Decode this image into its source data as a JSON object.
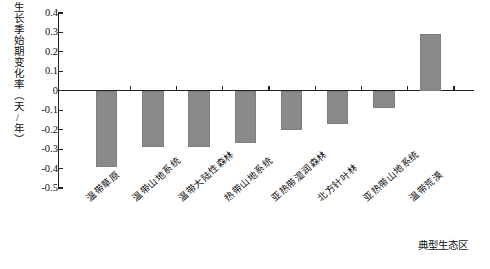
{
  "chart_data": {
    "type": "bar",
    "title": "",
    "subtitle": "",
    "xlabel": "典型生态区",
    "ylabel": "生长季始期变化率（天/年）",
    "categories": [
      "温带草原",
      "温带山地系统",
      "温带大陆性森林",
      "热带山地系统",
      "亚热带湿润森林",
      "北方针叶林",
      "亚热带山地系统",
      "温带荒漠"
    ],
    "values": [
      -0.39,
      -0.29,
      -0.29,
      -0.27,
      -0.2,
      -0.17,
      -0.09,
      0.29
    ],
    "ylim": [
      -0.5,
      0.4
    ],
    "yticks": [
      0.4,
      0.3,
      0.2,
      0.1,
      0,
      -0.1,
      -0.2,
      -0.3,
      -0.4,
      -0.5
    ],
    "ytick_labels": [
      "0.4",
      "0.3",
      "0.2",
      "0.1",
      "0",
      "-0.1",
      "-0.2",
      "-0.3",
      "-0.4",
      "-0.5"
    ],
    "grid": false,
    "legend": null,
    "legend_position": "none",
    "bar_color": "#8a8a8a",
    "axis_color": "#222222"
  }
}
